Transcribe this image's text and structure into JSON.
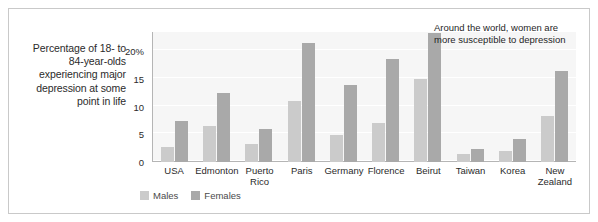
{
  "caption": "Percentage of 18- to 84-year-olds experiencing major depression at some point in life",
  "annotation": "Around the world, women are more susceptible to depression",
  "legend": {
    "males_label": "Males",
    "females_label": "Females"
  },
  "colors": {
    "male_bar": "#cbcbcb",
    "female_bar": "#a9a9a9",
    "plot_background": "#f6f6f6",
    "gridline": "#ffffff",
    "axis": "#b5b5b5",
    "frame_border": "#c9c9c9",
    "text": "#2b2b2b"
  },
  "chart_data": {
    "type": "bar",
    "title": "",
    "subtitle": "",
    "annotations": [
      "Around the world, women are more susceptible to depression"
    ],
    "xlabel": "",
    "ylabel": "Percentage of 18- to 84-year-olds experiencing major depression at some point in life",
    "ylim": [
      0,
      23.5
    ],
    "yticks": [
      0,
      5,
      10,
      15,
      20
    ],
    "ytick_labels": [
      "0",
      "5",
      "10",
      "15",
      "20%"
    ],
    "grid": true,
    "legend_position": "bottom-left",
    "categories": [
      "USA",
      "Edmonton",
      "Puerto Rico",
      "Paris",
      "Germany",
      "Florence",
      "Beirut",
      "Taiwan",
      "Korea",
      "New Zealand"
    ],
    "series": [
      {
        "name": "Males",
        "color": "#cbcbcb",
        "values": [
          2.8,
          6.5,
          3.2,
          11.0,
          4.8,
          7.0,
          15.0,
          1.5,
          2.0,
          8.3
        ]
      },
      {
        "name": "Females",
        "color": "#a9a9a9",
        "values": [
          7.5,
          12.5,
          6.0,
          21.5,
          14.0,
          18.7,
          23.3,
          2.3,
          4.2,
          16.5
        ]
      }
    ]
  }
}
